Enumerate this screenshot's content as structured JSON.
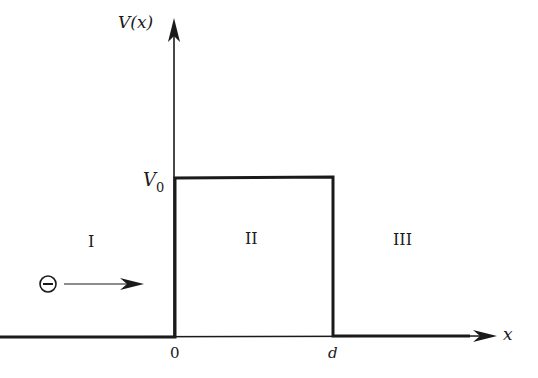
{
  "diagram": {
    "type": "potential-barrier",
    "y_axis_label": "V(x)",
    "x_axis_label": "x",
    "barrier_height_label": "V",
    "barrier_height_subscript": "0",
    "x_ticks": [
      "0",
      "d"
    ],
    "regions": [
      "I",
      "II",
      "III"
    ],
    "particle_symbol": "−",
    "particle_name": "electron",
    "particle_direction": "right"
  }
}
